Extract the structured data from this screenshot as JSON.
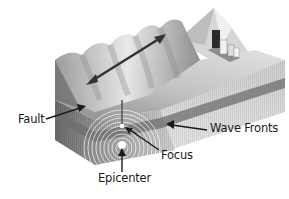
{
  "figure": {
    "labels": {
      "fault": "Fault",
      "wave_fronts": "Wave Fronts",
      "focus": "Focus",
      "epicenter": "Epicenter"
    },
    "colors": {
      "background": "#ffffff",
      "surface_light": "#d8d8d8",
      "surface_mid": "#a9a9a9",
      "surface_dark": "#6e6e6e",
      "fault_stripe": "#7a7a7a",
      "arrow": "#1a1a1a",
      "wave_rings": "#ffffff"
    }
  }
}
